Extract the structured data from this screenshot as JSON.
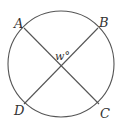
{
  "diagram": {
    "type": "circle-with-intersecting-chords",
    "points": {
      "A": "A",
      "B": "B",
      "C": "C",
      "D": "D"
    },
    "angle_label": "w°",
    "chords": [
      "AC",
      "BD"
    ],
    "stroke_color": "#555555"
  }
}
